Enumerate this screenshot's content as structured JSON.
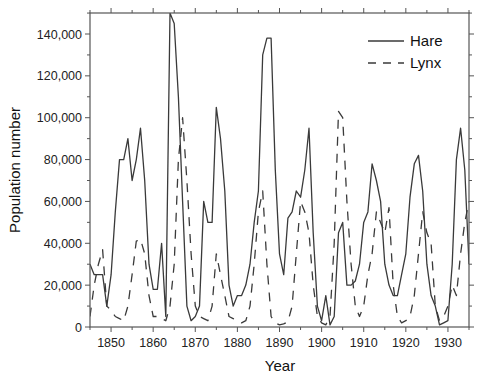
{
  "chart_data": {
    "type": "line",
    "title": "",
    "xlabel": "Year",
    "ylabel": "Population number",
    "xlim": [
      1845,
      1935
    ],
    "ylim": [
      0,
      150000
    ],
    "grid": false,
    "legend_position": "upper right",
    "x_ticks": [
      1850,
      1860,
      1870,
      1880,
      1890,
      1900,
      1910,
      1920,
      1930
    ],
    "x_tick_labels": [
      "1850",
      "1860",
      "1870",
      "1880",
      "1890",
      "1900",
      "1910",
      "1920",
      "1930"
    ],
    "y_ticks": [
      0,
      20000,
      40000,
      60000,
      80000,
      100000,
      120000,
      140000
    ],
    "y_tick_labels": [
      "0",
      "20,000",
      "40,000",
      "60,000",
      "80,000",
      "100,000",
      "120,000",
      "140,000"
    ],
    "x": [
      1845,
      1846,
      1847,
      1848,
      1849,
      1850,
      1851,
      1852,
      1853,
      1854,
      1855,
      1856,
      1857,
      1858,
      1859,
      1860,
      1861,
      1862,
      1863,
      1864,
      1865,
      1866,
      1867,
      1868,
      1869,
      1870,
      1871,
      1872,
      1873,
      1874,
      1875,
      1876,
      1877,
      1878,
      1879,
      1880,
      1881,
      1882,
      1883,
      1884,
      1885,
      1886,
      1887,
      1888,
      1889,
      1890,
      1891,
      1892,
      1893,
      1894,
      1895,
      1896,
      1897,
      1898,
      1899,
      1900,
      1901,
      1902,
      1903,
      1904,
      1905,
      1906,
      1907,
      1908,
      1909,
      1910,
      1911,
      1912,
      1913,
      1914,
      1915,
      1916,
      1917,
      1918,
      1919,
      1920,
      1921,
      1922,
      1923,
      1924,
      1925,
      1926,
      1927,
      1928,
      1929,
      1930,
      1931,
      1932,
      1933,
      1934,
      1935
    ],
    "series": [
      {
        "name": "Hare",
        "style": "solid",
        "values": [
          30000,
          25000,
          25000,
          25000,
          10000,
          25000,
          55000,
          80000,
          80000,
          90000,
          70000,
          80000,
          95000,
          70000,
          30000,
          18000,
          18000,
          40000,
          5000,
          150000,
          145000,
          110000,
          60000,
          10000,
          3000,
          5000,
          10000,
          60000,
          50000,
          50000,
          105000,
          90000,
          65000,
          20000,
          10000,
          15000,
          15000,
          20000,
          30000,
          50000,
          65000,
          130000,
          138000,
          138000,
          75000,
          35000,
          25000,
          52000,
          55000,
          65000,
          62000,
          75000,
          95000,
          45000,
          10000,
          3000,
          15000,
          1000,
          5000,
          45000,
          50000,
          20000,
          20000,
          22000,
          30000,
          50000,
          55000,
          78000,
          70000,
          60000,
          30000,
          20000,
          15000,
          15000,
          25000,
          35000,
          62000,
          78000,
          82000,
          65000,
          30000,
          15000,
          10000,
          1000,
          2000,
          3000,
          30000,
          80000,
          95000,
          75000,
          30000
        ]
      },
      {
        "name": "Lynx",
        "style": "dashed",
        "values": [
          5000,
          20000,
          30000,
          37000,
          10000,
          8000,
          5000,
          4000,
          3000,
          10000,
          25000,
          41000,
          42000,
          35000,
          15000,
          5000,
          5000,
          4000,
          3000,
          10000,
          30000,
          80000,
          100000,
          70000,
          35000,
          10000,
          5000,
          4000,
          3000,
          10000,
          35000,
          25000,
          15000,
          5000,
          4000,
          3000,
          2000,
          3000,
          10000,
          30000,
          55000,
          65000,
          30000,
          5000,
          2000,
          1000,
          1500,
          2500,
          10000,
          35000,
          60000,
          55000,
          45000,
          20000,
          5000,
          2000,
          1000,
          5000,
          40000,
          103000,
          100000,
          60000,
          30000,
          10000,
          5000,
          10000,
          25000,
          35000,
          55000,
          50000,
          45000,
          57000,
          20000,
          5000,
          2000,
          3000,
          5000,
          15000,
          35000,
          55000,
          45000,
          40000,
          10000,
          3000,
          5000,
          10000,
          20000,
          15000,
          35000,
          50000,
          60000
        ]
      }
    ]
  },
  "legend": {
    "items": [
      {
        "label": "Hare",
        "style": "solid"
      },
      {
        "label": "Lynx",
        "style": "dashed"
      }
    ]
  },
  "axes": {
    "xlabel": "Year",
    "ylabel": "Population number"
  },
  "colors": {
    "line": "#3a3a3a",
    "axis": "#555555",
    "background": "#ffffff"
  }
}
